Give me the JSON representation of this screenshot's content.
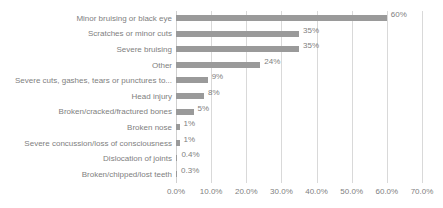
{
  "chart_data": {
    "type": "bar",
    "orientation": "horizontal",
    "title": "",
    "xlabel": "",
    "ylabel": "",
    "xlim": [
      0,
      70
    ],
    "xticks": [
      "0.0%",
      "10.0%",
      "20.0%",
      "30.0%",
      "40.0%",
      "50.0%",
      "60.0%",
      "70.0%"
    ],
    "xtick_values": [
      0,
      10,
      20,
      30,
      40,
      50,
      60,
      70
    ],
    "grid": "vertical",
    "legend": "none",
    "bar_color": "#9a9a9a",
    "gridline_color": "#d9d9d9",
    "text_color": "#808080",
    "categories": [
      "Minor bruising or black eye",
      "Scratches or minor cuts",
      "Severe bruising",
      "Other",
      "Severe cuts, gashes, tears or punctures to...",
      "Head injury",
      "Broken/cracked/fractured bones",
      "Broken nose",
      "Severe concussion/loss of consciousness",
      "Dislocation of joints",
      "Broken/chipped/lost teeth"
    ],
    "values": [
      60,
      35,
      35,
      24,
      9,
      8,
      5,
      1,
      1,
      0.4,
      0.3
    ],
    "labels": [
      "60%",
      "35%",
      "35%",
      "24%",
      "9%",
      "8%",
      "5%",
      "1%",
      "1%",
      "0.4%",
      "0.3%"
    ]
  }
}
